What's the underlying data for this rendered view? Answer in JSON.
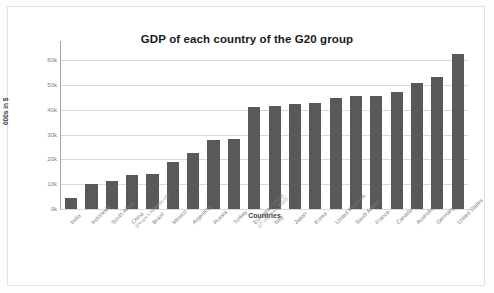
{
  "chart_data": {
    "type": "bar",
    "title": "GDP of each country of the G20 group",
    "xlabel": "Countries",
    "ylabel": "000s in $",
    "ylim": [
      0,
      65000
    ],
    "grid": true,
    "legend": false,
    "bar_color": "#595959",
    "gridline_color": "#d9d9d9",
    "axis_color": "#a6a6a6",
    "ytick_labels": [
      "0k",
      "10k",
      "20k",
      "30k",
      "40k",
      "50k",
      "60k"
    ],
    "ytick_values": [
      0,
      10000,
      20000,
      30000,
      40000,
      50000,
      60000
    ],
    "categories": [
      "India",
      "Indonesia",
      "South Africa",
      "China (People's Republic of)",
      "Brazil",
      "Mexico",
      "Argentina",
      "Russia",
      "Turkey",
      "European Union (27 countries, 2020)",
      "Italy",
      "Japan",
      "Korea",
      "United Kingdom",
      "Saudi Arabia",
      "France",
      "Canada",
      "Australia",
      "Germany",
      "United States"
    ],
    "category_labels": [
      {
        "line1": "India",
        "line2": ""
      },
      {
        "line1": "Indonesia",
        "line2": ""
      },
      {
        "line1": "South Africa",
        "line2": ""
      },
      {
        "line1": "China",
        "line2": "(People's Republic of)"
      },
      {
        "line1": "Brazil",
        "line2": ""
      },
      {
        "line1": "Mexico",
        "line2": ""
      },
      {
        "line1": "Argentina",
        "line2": ""
      },
      {
        "line1": "Russia",
        "line2": ""
      },
      {
        "line1": "Turkey",
        "line2": ""
      },
      {
        "line1": "European Union",
        "line2": "(27 countries, 2020)"
      },
      {
        "line1": "Italy",
        "line2": ""
      },
      {
        "line1": "Japan",
        "line2": ""
      },
      {
        "line1": "Korea",
        "line2": ""
      },
      {
        "line1": "United Kingdom",
        "line2": ""
      },
      {
        "line1": "Saudi Arabia",
        "line2": ""
      },
      {
        "line1": "France",
        "line2": ""
      },
      {
        "line1": "Canada",
        "line2": ""
      },
      {
        "line1": "Australia",
        "line2": ""
      },
      {
        "line1": "Germany",
        "line2": ""
      },
      {
        "line1": "United States",
        "line2": ""
      }
    ],
    "values": [
      4600,
      10300,
      11400,
      13600,
      14300,
      19000,
      22700,
      27900,
      28200,
      41000,
      41400,
      42200,
      42600,
      45000,
      45600,
      45700,
      47300,
      51000,
      53400,
      62700
    ]
  }
}
